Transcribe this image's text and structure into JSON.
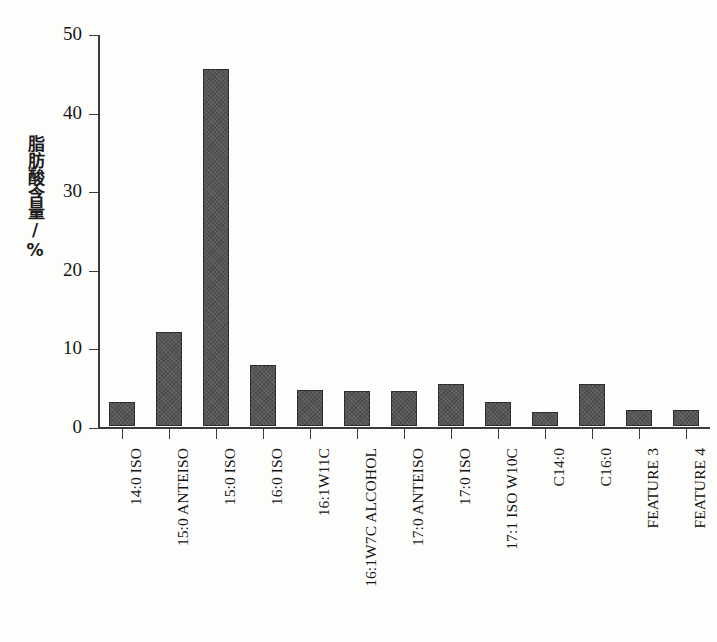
{
  "chart_data": {
    "type": "bar",
    "title": "",
    "subtitle": "",
    "xlabel": "",
    "ylabel": "脂肪酸含量/%",
    "ylim": [
      0,
      50
    ],
    "yticks": [
      0,
      10,
      20,
      30,
      40,
      50
    ],
    "grid": false,
    "legend": "none",
    "bar_color": "#565656",
    "axis_color": "#3b3b3b",
    "background": "#fdfdfc",
    "categories": [
      "14:0 ISO",
      "15:0 ANTEISO",
      "15:0 ISO",
      "16:0 ISO",
      "16:1W11C",
      "16:1W7C ALCOHOL",
      "17:0 ANTEISO",
      "17:0 ISO",
      "17:1 ISO W10C",
      "C14:0",
      "C16:0",
      "FEATURE 3",
      "FEATURE 4"
    ],
    "values": [
      3.0,
      11.9,
      45.4,
      7.8,
      4.6,
      4.4,
      4.5,
      5.4,
      3.0,
      1.8,
      5.4,
      2.1,
      2.1
    ],
    "n_bars": 13,
    "ytick_labels": [
      "0",
      "10",
      "20",
      "30",
      "40",
      "50"
    ]
  }
}
